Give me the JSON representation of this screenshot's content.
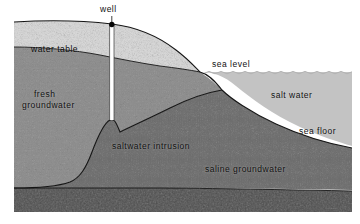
{
  "figure": {
    "frame": {
      "x": 14,
      "y": 14,
      "width": 338,
      "height": 198
    }
  },
  "colors": {
    "background": "#ffffff",
    "unsaturated_zone": "#d5d5d5",
    "fresh_groundwater": "#8e8e8e",
    "saline_groundwater": "#6f6f6f",
    "bedrock": "#4a4a4a",
    "salt_water_body": "#c3c3c3",
    "outline": "#151515",
    "well_casing": "#ffffff",
    "well_head": "#000000",
    "label_text": "#111111"
  },
  "labels": {
    "well": "well",
    "water_table": "water table",
    "fresh_groundwater_line1": "fresh",
    "fresh_groundwater_line2": "groundwater",
    "sea_level": "sea level",
    "salt_water": "salt  water",
    "sea_floor": "sea floor",
    "saltwater_intrusion": "saltwater intrusion",
    "saline_groundwater": "saline  groundwater"
  },
  "geometry": {
    "sea_level_y": 72,
    "land_surface_left_y": 22,
    "well_x": 112,
    "well_top_y": 24,
    "well_bottom_y": 120,
    "water_table_left_y": 47,
    "bedrock_top_y": 193
  }
}
